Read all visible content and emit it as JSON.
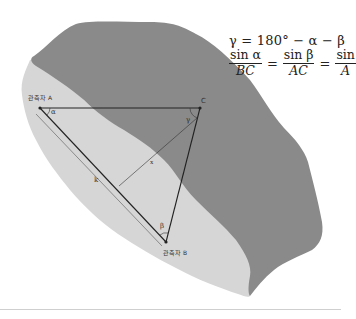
{
  "diagram": {
    "formula": {
      "line1": "γ = 180° − α − β",
      "fractions": [
        {
          "numerator": "sin α",
          "denominator": "BC"
        },
        {
          "numerator": "sin β",
          "denominator": "AC"
        },
        {
          "numerator": "sin",
          "denominator": "A"
        }
      ],
      "equals": "="
    },
    "points": {
      "A": {
        "label": "관측자 A",
        "x": 40,
        "y": 108
      },
      "B": {
        "label": "관측자 B",
        "x": 166,
        "y": 242
      },
      "C": {
        "label": "C",
        "x": 200,
        "y": 108
      }
    },
    "angles": {
      "alpha": "α",
      "beta": "β",
      "gamma": "γ"
    },
    "segments": {
      "baseline": "k",
      "height": "x"
    },
    "colors": {
      "dark_region": "#8a8a8a",
      "light_region": "#d6d6d6",
      "line": "#222222",
      "background": "#ffffff",
      "divider": "#cfcfcf"
    }
  }
}
